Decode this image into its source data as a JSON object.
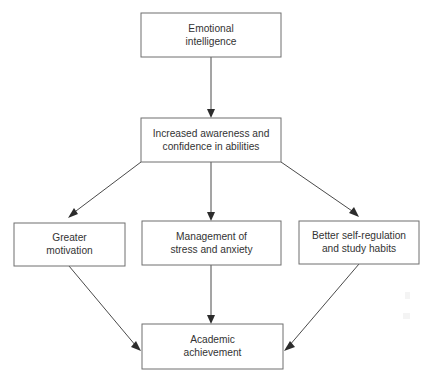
{
  "diagram": {
    "type": "flowchart",
    "direction": "top-to-bottom",
    "background_color": "#ffffff",
    "box_stroke_color": "#6f6f6f",
    "text_color": "#333333",
    "arrow_color": "#4a4a4a",
    "nodes": [
      {
        "id": "emotional-intelligence",
        "line1": "Emotional",
        "line2": "intelligence",
        "level": 1,
        "x": 141,
        "y": 13,
        "width": 140,
        "height": 44
      },
      {
        "id": "increased-awareness",
        "line1": "Increased awareness and",
        "line2": "confidence in abilities",
        "level": 2,
        "x": 141,
        "y": 118,
        "width": 140,
        "height": 44
      },
      {
        "id": "greater-motivation",
        "line1": "Greater",
        "line2": "motivation",
        "level": 3,
        "x": 14,
        "y": 223,
        "width": 111,
        "height": 43
      },
      {
        "id": "management-stress-anxiety",
        "line1": "Management of",
        "line2": "stress and anxiety",
        "level": 3,
        "x": 142,
        "y": 221,
        "width": 139,
        "height": 44
      },
      {
        "id": "better-self-regulation",
        "line1": "Better self-regulation",
        "line2": "and study habits",
        "level": 3,
        "x": 299,
        "y": 221,
        "width": 120,
        "height": 43
      },
      {
        "id": "academic-achievement",
        "line1": "Academic",
        "line2": "achievement",
        "level": 4,
        "x": 142,
        "y": 324,
        "width": 141,
        "height": 45
      }
    ],
    "edges": [
      {
        "id": "ei-to-awareness",
        "from": "emotional-intelligence",
        "to": "increased-awareness",
        "style": "straight-vertical"
      },
      {
        "id": "awareness-to-motivation",
        "from": "increased-awareness",
        "to": "greater-motivation",
        "style": "diagonal-left"
      },
      {
        "id": "awareness-to-stress",
        "from": "increased-awareness",
        "to": "management-stress-anxiety",
        "style": "straight-vertical"
      },
      {
        "id": "awareness-to-selfreg",
        "from": "increased-awareness",
        "to": "better-self-regulation",
        "style": "diagonal-right"
      },
      {
        "id": "motivation-to-academic",
        "from": "greater-motivation",
        "to": "academic-achievement",
        "style": "diagonal-right"
      },
      {
        "id": "stress-to-academic",
        "from": "management-stress-anxiety",
        "to": "academic-achievement",
        "style": "straight-vertical"
      },
      {
        "id": "selfreg-to-academic",
        "from": "better-self-regulation",
        "to": "academic-achievement",
        "style": "diagonal-left"
      }
    ]
  }
}
